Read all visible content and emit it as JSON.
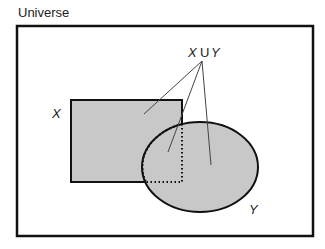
{
  "diagram": {
    "universe_label": "Universe",
    "set_x_label": "X",
    "set_y_label": "Y",
    "union_label_x": "X",
    "union_label_op": "U",
    "union_label_y": "Y",
    "colors": {
      "fill": "#c8c8c8",
      "stroke": "#111111",
      "background": "#ffffff"
    }
  }
}
